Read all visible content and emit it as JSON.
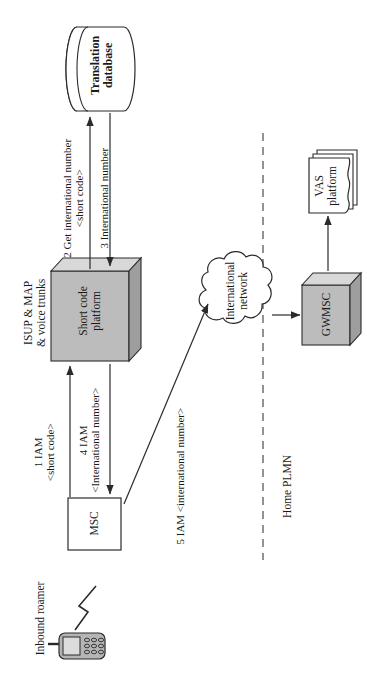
{
  "diagram": {
    "orientation": "rotated-90-ccw",
    "colors": {
      "box_front": "#bcbcbc",
      "box_top": "#d8d8d8",
      "box_side": "#9e9e9e",
      "stroke": "#2b2b2b",
      "text": "#1a1a1a",
      "paper": "#ffffff"
    },
    "nodes": [
      {
        "id": "translation-database",
        "label": "Translation\ndatabase",
        "line1": "Translation",
        "line2": "database",
        "shape": "cylinder",
        "bold": true
      },
      {
        "id": "short-code-platform",
        "label": "Short code\nplatform",
        "line1": "Short code",
        "line2": "platform",
        "shape": "cube-3d",
        "bold": false
      },
      {
        "id": "msc",
        "label": "MSC",
        "line1": "MSC",
        "line2": "",
        "shape": "rectangle",
        "bold": false
      },
      {
        "id": "international-network",
        "label": "International\nnetwork",
        "line1": "International",
        "line2": "network",
        "shape": "cloud",
        "bold": false
      },
      {
        "id": "gwmsc",
        "label": "GWMSC",
        "line1": "GWMSC",
        "line2": "",
        "shape": "cube-3d",
        "bold": false
      },
      {
        "id": "vas-platform",
        "label": "VAS\nplatform",
        "line1": "VAS",
        "line2": "platform",
        "shape": "document-stack",
        "bold": false
      },
      {
        "id": "inbound-roamer",
        "label": "Inbound roamer",
        "line1": "Inbound roamer",
        "line2": "",
        "shape": "mobile-phone",
        "bold": false
      }
    ],
    "edge_labels": [
      {
        "id": "step-1",
        "line1": "1 IAM",
        "line2": "<short code>"
      },
      {
        "id": "step-2",
        "line1": "2 Get international number",
        "line2": "<short code>"
      },
      {
        "id": "step-3",
        "line1": "3 International number",
        "line2": ""
      },
      {
        "id": "step-4",
        "line1": "4 IAM",
        "line2": "<International number>"
      },
      {
        "id": "step-5",
        "line1": "5 IAM <international number>",
        "line2": ""
      }
    ],
    "annotations": [
      {
        "id": "trunk-annotation",
        "line1": "ISUP & MAP",
        "line2": "& voice trunks"
      },
      {
        "id": "home-plmn-annotation",
        "line1": "Home PLMN",
        "line2": ""
      }
    ]
  }
}
